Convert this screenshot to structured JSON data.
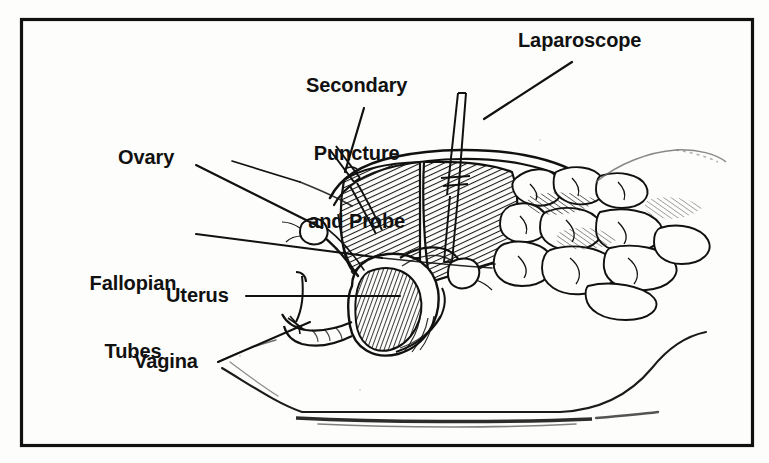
{
  "figure": {
    "frame_color": "#111111",
    "background_color": "#fdfdfb",
    "line_color": "#111111"
  },
  "labels": {
    "ovary": "Ovary",
    "secondary_line1": "Secondary",
    "secondary_line2": "Puncture",
    "secondary_line3": "and Probe",
    "laparoscope": "Laparoscope",
    "fallopian_line1": "Fallopian",
    "fallopian_line2": "Tubes",
    "uterus": "Uterus",
    "vagina": "Vagina"
  }
}
